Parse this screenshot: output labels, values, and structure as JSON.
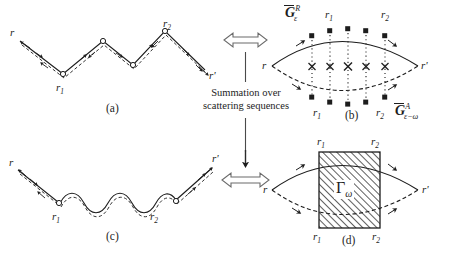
{
  "figure": {
    "background_color": "#ffffff",
    "line_color": "#1d1d1d",
    "width": 467,
    "height": 256
  },
  "panels": [
    {
      "id": "a",
      "caption": "(a)",
      "type": "real-space-zigzag-trajectory",
      "start_label": "r",
      "end_label": "r'",
      "scatterer_labels": [
        "r",
        "r"
      ],
      "scatterer_subscripts": [
        "1",
        "2"
      ]
    },
    {
      "id": "b",
      "caption": "(b)",
      "type": "ladder-diagram",
      "start_label": "r",
      "end_label": "r'",
      "top_propagator": {
        "symbol": "G",
        "superscript": "R",
        "subscript": "ε"
      },
      "bottom_propagator": {
        "symbol": "G",
        "superscript": "A",
        "subscript": "ε−ω"
      },
      "rung_count": 5,
      "top_labels": [
        "r",
        "r"
      ],
      "top_label_subscripts": [
        "1",
        "2"
      ],
      "bottom_labels": [
        "r",
        "r"
      ],
      "bottom_label_subscripts": [
        "1",
        "2"
      ]
    },
    {
      "id": "c",
      "caption": "(c)",
      "type": "real-space-diffuson-trajectory",
      "start_label": "r",
      "end_label": "r'",
      "scatterer_labels": [
        "r",
        "r"
      ],
      "scatterer_subscripts": [
        "1",
        "2"
      ]
    },
    {
      "id": "d",
      "caption": "(d)",
      "type": "vertex-block-diagram",
      "start_label": "r",
      "end_label": "r'",
      "block_symbol": "Γ",
      "block_subscript": "ω",
      "top_labels": [
        "r",
        "r"
      ],
      "top_label_subscripts": [
        "1",
        "2"
      ],
      "bottom_labels": [
        "r",
        "r"
      ],
      "bottom_label_subscripts": [
        "1",
        "2"
      ]
    }
  ],
  "center_annotation": {
    "line1": "Summation over",
    "line2": "scattering  sequences",
    "top_arrow": "double-headed-hollow-arrow",
    "bottom_arrow": "right-hollow-arrow",
    "vertical_arrow": "down-arrow"
  }
}
